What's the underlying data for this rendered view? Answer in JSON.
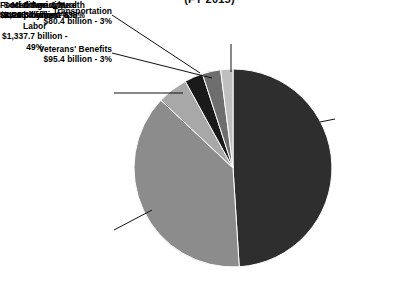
{
  "chart_data": {
    "type": "pie",
    "title": "(FY 2015)",
    "subtitle": "",
    "xlabel": "",
    "ylabel": "",
    "legend_position": "callout-labels",
    "grid": false,
    "units": "billions of dollars",
    "categories": [
      "Social Security, Unemployment & Labor",
      "Medicare & Health",
      "Food & Agriculture",
      "Veterans' Benefits",
      "Transportation",
      "Other"
    ],
    "values": [
      1337.7,
      1045.4,
      126.3,
      95.4,
      80.4,
      44.9
    ],
    "percents": [
      49,
      38,
      5,
      3,
      3,
      2
    ],
    "colors": [
      "#2e2e2e",
      "#8c8c8c",
      "#a8a8a8",
      "#1a1a1a",
      "#6e6e6e",
      "#bfbfbf"
    ],
    "slices": [
      {
        "id": "social-security",
        "name": "Social Security, Unemployment & Labor",
        "name_line1": "Social Security,",
        "name_line2": "Unemployment &",
        "name_line3": "Labor",
        "amount_text": "$1,337.7 billion -",
        "percent_text": "49%",
        "value": 1337.7,
        "percent": 49,
        "color": "#2e2e2e"
      },
      {
        "id": "medicare-health",
        "name": "Medicare & Health",
        "name_line1": "Medicare & Health",
        "amount_text": "$1,045.4 billion - 38%",
        "value": 1045.4,
        "percent": 38,
        "color": "#8c8c8c"
      },
      {
        "id": "food-agriculture",
        "name": "Food & Agriculture",
        "name_line1": "Food & Agriculture",
        "amount_text": "$126.3 billion - 5%",
        "value": 126.3,
        "percent": 5,
        "color": "#a8a8a8"
      },
      {
        "id": "veterans-benefits",
        "name": "Veterans' Benefits",
        "name_line1": "Veterans' Benefits",
        "amount_text": "$95.4 billion - 3%",
        "value": 95.4,
        "percent": 3,
        "color": "#1a1a1a"
      },
      {
        "id": "transportation",
        "name": "Transportation",
        "name_line1": "Transportation",
        "amount_text": "$80.4 billion - 3%",
        "value": 80.4,
        "percent": 3,
        "color": "#6e6e6e"
      },
      {
        "id": "other",
        "name": "Other",
        "name_line1": "Other",
        "amount_text": "$44.9 billion - 2%",
        "value": 44.9,
        "percent": 2,
        "color": "#bfbfbf"
      }
    ]
  },
  "geometry": {
    "center_x": 233,
    "center_y": 168,
    "radius": 99,
    "start_angle_deg": -90,
    "direction": "clockwise"
  },
  "style": {
    "background": "#ffffff",
    "text_color": "#000000",
    "leader_line_color": "#111111"
  }
}
